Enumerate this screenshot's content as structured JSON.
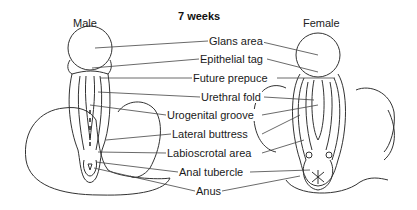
{
  "diagram": {
    "title": "7 weeks",
    "left_caption": "Male",
    "right_caption": "Female",
    "labels": [
      {
        "text": "Glans area",
        "x": 208,
        "y": 36
      },
      {
        "text": "Epithelial tag",
        "x": 199,
        "y": 54
      },
      {
        "text": "Future prepuce",
        "x": 192,
        "y": 73
      },
      {
        "text": "Urethral fold",
        "x": 200,
        "y": 92
      },
      {
        "text": "Urogenital groove",
        "x": 166,
        "y": 110
      },
      {
        "text": "Lateral buttress",
        "x": 171,
        "y": 129
      },
      {
        "text": "Labioscrotal area",
        "x": 166,
        "y": 148
      },
      {
        "text": "Anal tubercle",
        "x": 178,
        "y": 167
      },
      {
        "text": "Anus",
        "x": 195,
        "y": 186
      }
    ],
    "line_color": "#333333"
  }
}
